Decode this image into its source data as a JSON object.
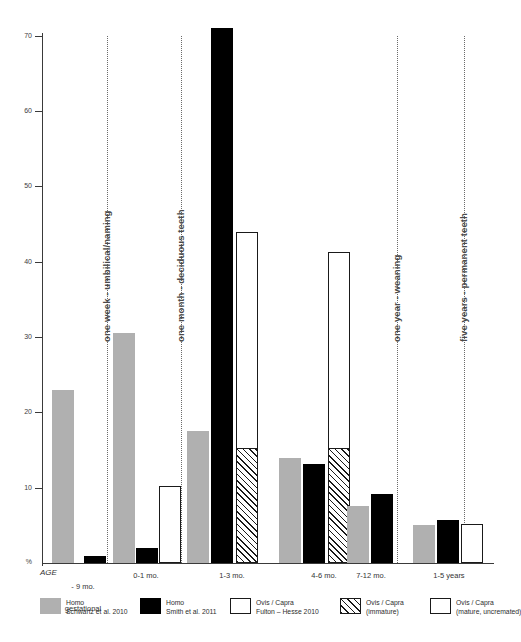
{
  "chart_data": {
    "type": "bar",
    "title": "",
    "subtitle": "",
    "xlabel": "AGE",
    "ylabel": "%",
    "ylim": [
      0,
      70
    ],
    "grid": false,
    "legend_position": "bottom",
    "y_ticks": [
      "%",
      "10",
      "20",
      "30",
      "40",
      "50",
      "60",
      "70"
    ],
    "y_tick_values": [
      0,
      10,
      20,
      30,
      40,
      50,
      60,
      70
    ],
    "categories": [
      "- 9 mo.\ngestational",
      "0-1 mo.",
      "1-3 mo.",
      "4-6 mo.",
      "7-12 mo.",
      "1-5 years"
    ],
    "series": [
      {
        "name": "Homo Schwartz et al. 2010",
        "fill": "gray",
        "values": [
          23.0,
          30.5,
          17.5,
          14.0,
          7.6,
          5.0
        ]
      },
      {
        "name": "Homo Smith et al. 2011",
        "fill": "black",
        "values": [
          0.9,
          2.0,
          71.0,
          13.2,
          9.2,
          5.7
        ]
      },
      {
        "name": "Ovis / Capra Fulton - Hesse 2010",
        "fill": "white",
        "values": [
          0,
          10.2,
          44.0,
          41.3,
          0,
          5.2
        ]
      },
      {
        "name": "Ovis / Capra (immature)",
        "fill": "hatched",
        "values": [
          0,
          0,
          15.3,
          15.3,
          0,
          0
        ]
      }
    ],
    "annotations": [
      {
        "label": "one week - umbilical/naming",
        "x_position_pct": 14.5
      },
      {
        "label": "one month - deciduous teeth",
        "x_position_pct": 31.0
      },
      {
        "label": "one year - weaning",
        "x_position_pct": 78.5
      },
      {
        "label": "five years - permanent teeth",
        "x_position_pct": 95.0
      }
    ]
  },
  "axis": {
    "y_label": "%",
    "x_origin_label": "AGE",
    "ticks": [
      {
        "label": "70",
        "value": 70
      },
      {
        "label": "60",
        "value": 60
      },
      {
        "label": "50",
        "value": 50
      },
      {
        "label": "40",
        "value": 40
      },
      {
        "label": "30",
        "value": 30
      },
      {
        "label": "20",
        "value": 20
      },
      {
        "label": "10",
        "value": 10
      },
      {
        "label": "%",
        "value": 0
      }
    ]
  },
  "categories": {
    "c0_line1": "- 9 mo.",
    "c0_line2": "gestational",
    "c1": "0-1 mo.",
    "c2": "1-3 mo.",
    "c3": "4-6 mo.",
    "c4": "7-12 mo.",
    "c5": "1-5 years"
  },
  "annotations": {
    "a0": "one week - umbilical/naming",
    "a1": "one month - deciduous teeth",
    "a2": "one year - weaning",
    "a3": "five years - permanent teeth"
  },
  "legend": {
    "items": [
      {
        "line1": "Homo",
        "line2": "Schwartz et al. 2010",
        "swatch": "gray"
      },
      {
        "line1": "Homo",
        "line2": "Smith et al. 2011",
        "swatch": "black"
      },
      {
        "line1": "Ovis / Capra",
        "line2": "Fulton – Hesse 2010",
        "swatch": "white"
      },
      {
        "line1": "Ovis / Capra",
        "line2": "(immature)",
        "swatch": "hatched"
      },
      {
        "line1": "Ovis / Capra",
        "line2": "(mature, uncremated)",
        "swatch": "white"
      }
    ]
  },
  "colors": {
    "gray": "#b0b0b0",
    "black": "#000000",
    "white": "#ffffff",
    "outline": "#1a1a1a",
    "axis": "#3a3a3a",
    "annotation_text": "#4a4a4a"
  }
}
